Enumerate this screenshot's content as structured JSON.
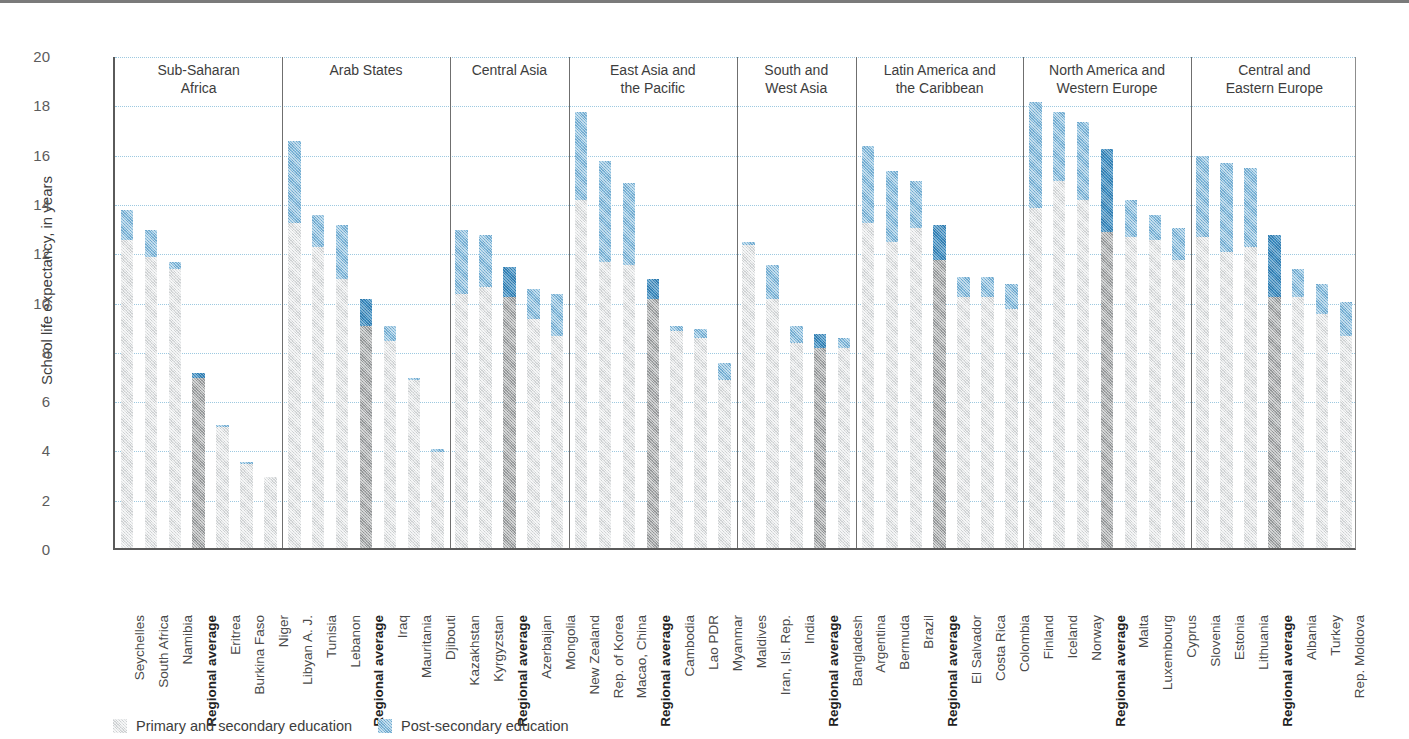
{
  "chart_data": {
    "type": "bar",
    "subtype": "stacked-bar-grouped",
    "title": "",
    "xlabel": "",
    "ylabel": "School life expectancy, in years",
    "ylim": [
      0,
      20
    ],
    "ytick_step": 2,
    "yticks": [
      "20",
      "18",
      "16",
      "14",
      "12",
      "10",
      "8",
      "6",
      "4",
      "2",
      "0"
    ],
    "grid": true,
    "legend_position": "bottom-left",
    "legend": [
      {
        "key": "primary_secondary",
        "label": "Primary and secondary education",
        "color": "#e0e2e3"
      },
      {
        "key": "post_secondary",
        "label": "Post-secondary education",
        "color": "#86bcdd"
      }
    ],
    "average_colors": {
      "primary_secondary": "#a8aaab",
      "post_secondary": "#3d8fc4"
    },
    "series": [
      {
        "name": "Primary and secondary education",
        "key": "primary_secondary"
      },
      {
        "name": "Post-secondary education",
        "key": "post_secondary"
      }
    ],
    "regions": [
      {
        "name": "Sub-Saharan Africa",
        "name_lines": [
          "Sub-Saharan",
          "Africa"
        ],
        "bars": [
          {
            "label": "Seychelles",
            "is_average": false,
            "primary_secondary": 12.5,
            "post_secondary": 1.2,
            "total": 13.7
          },
          {
            "label": "South Africa",
            "is_average": false,
            "primary_secondary": 11.8,
            "post_secondary": 1.1,
            "total": 12.9
          },
          {
            "label": "Namibia",
            "is_average": false,
            "primary_secondary": 11.3,
            "post_secondary": 0.3,
            "total": 11.6
          },
          {
            "label": "Regional average",
            "is_average": true,
            "primary_secondary": 6.9,
            "post_secondary": 0.2,
            "total": 7.1
          },
          {
            "label": "Eritrea",
            "is_average": false,
            "primary_secondary": 4.9,
            "post_secondary": 0.1,
            "total": 5.0
          },
          {
            "label": "Burkina Faso",
            "is_average": false,
            "primary_secondary": 3.4,
            "post_secondary": 0.1,
            "total": 3.5
          },
          {
            "label": "Niger",
            "is_average": false,
            "primary_secondary": 2.9,
            "post_secondary": 0.0,
            "total": 2.9
          }
        ]
      },
      {
        "name": "Arab States",
        "name_lines": [
          "Arab States"
        ],
        "bars": [
          {
            "label": "Libyan A. J.",
            "is_average": false,
            "primary_secondary": 13.2,
            "post_secondary": 3.3,
            "total": 16.5
          },
          {
            "label": "Tunisia",
            "is_average": false,
            "primary_secondary": 12.2,
            "post_secondary": 1.3,
            "total": 13.5
          },
          {
            "label": "Lebanon",
            "is_average": false,
            "primary_secondary": 10.9,
            "post_secondary": 2.2,
            "total": 13.1
          },
          {
            "label": "Regional average",
            "is_average": true,
            "primary_secondary": 9.0,
            "post_secondary": 1.1,
            "total": 10.1
          },
          {
            "label": "Iraq",
            "is_average": false,
            "primary_secondary": 8.4,
            "post_secondary": 0.6,
            "total": 9.0
          },
          {
            "label": "Mauritania",
            "is_average": false,
            "primary_secondary": 6.8,
            "post_secondary": 0.1,
            "total": 6.9
          },
          {
            "label": "Djibouti",
            "is_average": false,
            "primary_secondary": 3.9,
            "post_secondary": 0.1,
            "total": 4.0
          }
        ]
      },
      {
        "name": "Central Asia",
        "name_lines": [
          "Central Asia"
        ],
        "bars": [
          {
            "label": "Kazakhstan",
            "is_average": false,
            "primary_secondary": 10.3,
            "post_secondary": 2.6,
            "total": 12.9
          },
          {
            "label": "Kyrgyzstan",
            "is_average": false,
            "primary_secondary": 10.6,
            "post_secondary": 2.1,
            "total": 12.7
          },
          {
            "label": "Regional average",
            "is_average": true,
            "primary_secondary": 10.2,
            "post_secondary": 1.2,
            "total": 11.4
          },
          {
            "label": "Azerbaijan",
            "is_average": false,
            "primary_secondary": 9.3,
            "post_secondary": 1.2,
            "total": 10.5
          },
          {
            "label": "Mongolia",
            "is_average": false,
            "primary_secondary": 8.6,
            "post_secondary": 1.7,
            "total": 10.3
          }
        ]
      },
      {
        "name": "East Asia and the Pacific",
        "name_lines": [
          "East Asia and",
          "the Pacific"
        ],
        "bars": [
          {
            "label": "New Zealand",
            "is_average": false,
            "primary_secondary": 14.1,
            "post_secondary": 3.6,
            "total": 17.7
          },
          {
            "label": "Rep. of Korea",
            "is_average": false,
            "primary_secondary": 11.6,
            "post_secondary": 4.1,
            "total": 15.7
          },
          {
            "label": "Macao, China",
            "is_average": false,
            "primary_secondary": 11.5,
            "post_secondary": 3.3,
            "total": 14.8
          },
          {
            "label": "Regional average",
            "is_average": true,
            "primary_secondary": 10.1,
            "post_secondary": 0.8,
            "total": 10.9
          },
          {
            "label": "Cambodia",
            "is_average": false,
            "primary_secondary": 8.8,
            "post_secondary": 0.2,
            "total": 9.0
          },
          {
            "label": "Lao PDR",
            "is_average": false,
            "primary_secondary": 8.5,
            "post_secondary": 0.4,
            "total": 8.9
          },
          {
            "label": "Myanmar",
            "is_average": false,
            "primary_secondary": 6.8,
            "post_secondary": 0.7,
            "total": 7.5
          }
        ]
      },
      {
        "name": "South and West Asia",
        "name_lines": [
          "South and",
          "West Asia"
        ],
        "bars": [
          {
            "label": "Maldives",
            "is_average": false,
            "primary_secondary": 12.3,
            "post_secondary": 0.1,
            "total": 12.4
          },
          {
            "label": "Iran, Isl. Rep.",
            "is_average": false,
            "primary_secondary": 10.1,
            "post_secondary": 1.4,
            "total": 11.5
          },
          {
            "label": "India",
            "is_average": false,
            "primary_secondary": 8.3,
            "post_secondary": 0.7,
            "total": 9.0
          },
          {
            "label": "Regional average",
            "is_average": true,
            "primary_secondary": 8.1,
            "post_secondary": 0.6,
            "total": 8.7
          },
          {
            "label": "Bangladesh",
            "is_average": false,
            "primary_secondary": 8.1,
            "post_secondary": 0.4,
            "total": 8.5
          }
        ]
      },
      {
        "name": "Latin America and the Caribbean",
        "name_lines": [
          "Latin America and",
          "the Caribbean"
        ],
        "bars": [
          {
            "label": "Argentina",
            "is_average": false,
            "primary_secondary": 13.2,
            "post_secondary": 3.1,
            "total": 16.3
          },
          {
            "label": "Bermuda",
            "is_average": false,
            "primary_secondary": 12.4,
            "post_secondary": 2.9,
            "total": 15.3
          },
          {
            "label": "Brazil",
            "is_average": false,
            "primary_secondary": 13.0,
            "post_secondary": 1.9,
            "total": 14.9
          },
          {
            "label": "Regional average",
            "is_average": true,
            "primary_secondary": 11.7,
            "post_secondary": 1.4,
            "total": 13.1
          },
          {
            "label": "El Salvador",
            "is_average": false,
            "primary_secondary": 10.2,
            "post_secondary": 0.8,
            "total": 11.0
          },
          {
            "label": "Costa Rica",
            "is_average": false,
            "primary_secondary": 10.2,
            "post_secondary": 0.8,
            "total": 11.0
          },
          {
            "label": "Colombia",
            "is_average": false,
            "primary_secondary": 9.7,
            "post_secondary": 1.0,
            "total": 10.7
          }
        ]
      },
      {
        "name": "North America and Western Europe",
        "name_lines": [
          "North America and",
          "Western Europe"
        ],
        "bars": [
          {
            "label": "Finland",
            "is_average": false,
            "primary_secondary": 13.8,
            "post_secondary": 4.3,
            "total": 18.1
          },
          {
            "label": "Iceland",
            "is_average": false,
            "primary_secondary": 14.9,
            "post_secondary": 2.8,
            "total": 17.7
          },
          {
            "label": "Norway",
            "is_average": false,
            "primary_secondary": 14.1,
            "post_secondary": 3.2,
            "total": 17.3
          },
          {
            "label": "Regional average",
            "is_average": true,
            "primary_secondary": 12.8,
            "post_secondary": 3.4,
            "total": 16.2
          },
          {
            "label": "Malta",
            "is_average": false,
            "primary_secondary": 12.6,
            "post_secondary": 1.5,
            "total": 14.1
          },
          {
            "label": "Luxembourg",
            "is_average": false,
            "primary_secondary": 12.5,
            "post_secondary": 1.0,
            "total": 13.5
          },
          {
            "label": "Cyprus",
            "is_average": false,
            "primary_secondary": 11.7,
            "post_secondary": 1.3,
            "total": 13.0
          }
        ]
      },
      {
        "name": "Central and Eastern Europe",
        "name_lines": [
          "Central and",
          "Eastern Europe"
        ],
        "bars": [
          {
            "label": "Slovenia",
            "is_average": false,
            "primary_secondary": 12.6,
            "post_secondary": 3.3,
            "total": 15.9
          },
          {
            "label": "Estonia",
            "is_average": false,
            "primary_secondary": 12.0,
            "post_secondary": 3.6,
            "total": 15.6
          },
          {
            "label": "Lithuania",
            "is_average": false,
            "primary_secondary": 12.2,
            "post_secondary": 3.2,
            "total": 15.4
          },
          {
            "label": "Regional average",
            "is_average": true,
            "primary_secondary": 10.2,
            "post_secondary": 2.5,
            "total": 12.7
          },
          {
            "label": "Albania",
            "is_average": false,
            "primary_secondary": 10.2,
            "post_secondary": 1.1,
            "total": 11.3
          },
          {
            "label": "Turkey",
            "is_average": false,
            "primary_secondary": 9.5,
            "post_secondary": 1.2,
            "total": 10.7
          },
          {
            "label": "Rep. Moldova",
            "is_average": false,
            "primary_secondary": 8.6,
            "post_secondary": 1.4,
            "total": 10.0
          }
        ]
      }
    ]
  }
}
